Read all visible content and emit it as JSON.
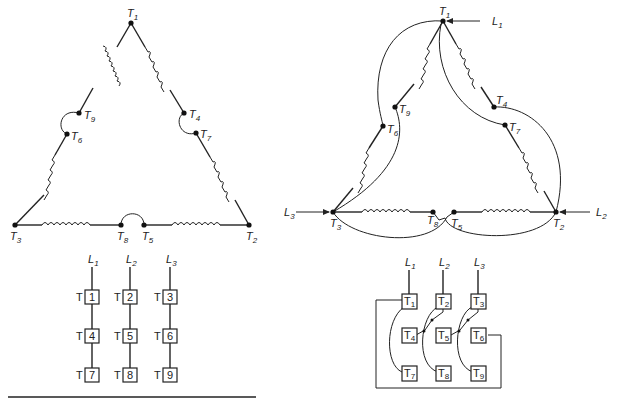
{
  "figure": {
    "left": {
      "title": "Low-voltage delta connection (unconnected leads shown)",
      "terminals": [
        {
          "id": "T1",
          "label": "T",
          "sub": "1"
        },
        {
          "id": "T2",
          "label": "T",
          "sub": "2"
        },
        {
          "id": "T3",
          "label": "T",
          "sub": "3"
        },
        {
          "id": "T4",
          "label": "T",
          "sub": "4"
        },
        {
          "id": "T5",
          "label": "T",
          "sub": "5"
        },
        {
          "id": "T6",
          "label": "T",
          "sub": "6"
        },
        {
          "id": "T7",
          "label": "T",
          "sub": "7"
        },
        {
          "id": "T8",
          "label": "T",
          "sub": "8"
        },
        {
          "id": "T9",
          "label": "T",
          "sub": "9"
        }
      ],
      "table": {
        "lines": [
          "L",
          "L",
          "L"
        ],
        "line_subs": [
          "1",
          "2",
          "3"
        ],
        "prefix": "T",
        "columns": [
          [
            "1",
            "4",
            "7"
          ],
          [
            "2",
            "5",
            "8"
          ],
          [
            "3",
            "6",
            "9"
          ]
        ]
      }
    },
    "right": {
      "lines": [
        {
          "label": "L",
          "sub": "1"
        },
        {
          "label": "L",
          "sub": "2"
        },
        {
          "label": "L",
          "sub": "3"
        }
      ],
      "terminals": [
        {
          "id": "T1",
          "label": "T",
          "sub": "1"
        },
        {
          "id": "T2",
          "label": "T",
          "sub": "2"
        },
        {
          "id": "T3",
          "label": "T",
          "sub": "3"
        },
        {
          "id": "T4",
          "label": "T",
          "sub": "4"
        },
        {
          "id": "T5",
          "label": "T",
          "sub": "5"
        },
        {
          "id": "T6",
          "label": "T",
          "sub": "6"
        },
        {
          "id": "T7",
          "label": "T",
          "sub": "7"
        },
        {
          "id": "T8",
          "label": "T",
          "sub": "8"
        },
        {
          "id": "T9",
          "label": "T",
          "sub": "9"
        }
      ],
      "table": {
        "lines": [
          "L",
          "L",
          "L"
        ],
        "line_subs": [
          "1",
          "2",
          "3"
        ],
        "grid": [
          [
            "T",
            "T",
            "T"
          ],
          [
            "T",
            "T",
            "T"
          ],
          [
            "T",
            "T",
            "T"
          ]
        ],
        "subs": [
          [
            "1",
            "2",
            "3"
          ],
          [
            "4",
            "5",
            "6"
          ],
          [
            "7",
            "8",
            "9"
          ]
        ]
      }
    }
  }
}
